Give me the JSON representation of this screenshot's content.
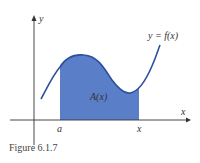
{
  "figure": {
    "caption": "Figure 6.1.7",
    "curve_label": "y = f(x)",
    "area_label": "A(x)",
    "x_axis_label": "x",
    "y_axis_label": "y",
    "tick_a": "a",
    "tick_x": "x",
    "colors": {
      "fill": "#5b7ec9",
      "curve": "#2c4f9e",
      "axis": "#333333"
    }
  }
}
